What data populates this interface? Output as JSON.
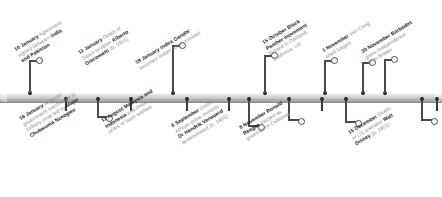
{
  "figure": {
    "name": "1966 events timeline",
    "orientation": "horizontal",
    "axis_color": "#c2c2c2",
    "date_color": "#1c1c1c",
    "body_color": "#8d8d8d",
    "label_rotation_deg": -31
  },
  "chart_data": {
    "type": "table",
    "title": "",
    "xlabel": "",
    "ylabel": "",
    "events": [
      {
        "date": "10 January",
        "side": "above",
        "lines": [
          [
            {
              "t": "10 January",
              "b": true
            },
            {
              "t": " Agreement",
              "b": false
            }
          ],
          [
            {
              "t": "signed between ",
              "b": false
            },
            {
              "t": "India",
              "b": true
            }
          ],
          [
            {
              "t": "and Pakistan",
              "b": true
            }
          ]
        ],
        "text": "10 January Agreement signed between India and Pakistan"
      },
      {
        "date": "11 January",
        "side": "above",
        "lines": [
          [
            {
              "t": "11 January",
              "b": true
            },
            {
              "t": " Death of",
              "b": false
            }
          ],
          [
            {
              "t": "Swiss sculptor ",
              "b": false
            },
            {
              "t": "Alberto",
              "b": true
            }
          ],
          [
            {
              "t": "Giacometti",
              "b": true
            },
            {
              "t": " (b. 1901)",
              "b": false
            }
          ]
        ],
        "text": "11 January Death of Swiss sculptor Alberto Giacometti (b. 1901)"
      },
      {
        "date": "16 January",
        "side": "below",
        "lines": [
          [
            {
              "t": "16 January",
              "b": true
            },
            {
              "t": " Nigerian",
              "b": false
            }
          ],
          [
            {
              "t": "government overthrown in",
              "b": false
            }
          ],
          [
            {
              "t": "military coup led by ",
              "b": false
            },
            {
              "t": "Major",
              "b": true
            }
          ],
          [
            {
              "t": "Chukwuma Nzeogwu",
              "b": true
            }
          ]
        ],
        "text": "16 January Nigerian government overthrown in military coup led by Major Chukwuma Nzeogwu"
      },
      {
        "date": "19 January",
        "side": "above",
        "lines": [
          [
            {
              "t": "19 January Indira Gandhi",
              "b": true
            }
          ],
          [
            {
              "t": "becomes Indian prime minister",
              "b": false
            }
          ]
        ],
        "text": "19 January Indira Gandhi becomes Indian prime minister"
      },
      {
        "date": "11 August",
        "side": "below",
        "lines": [
          [
            {
              "t": "11 August Malaysia and",
              "b": true
            }
          ],
          [
            {
              "t": "Indonesia",
              "b": true
            },
            {
              "t": " end three",
              "b": false
            }
          ],
          [
            {
              "t": "years of bush warfare",
              "b": false
            }
          ]
        ],
        "text": "11 August Malaysia and Indonesia end three years of bush warfare"
      },
      {
        "date": "6 September",
        "side": "below",
        "lines": [
          [
            {
              "t": "6 September",
              "b": true
            },
            {
              "t": " South",
              "b": false
            }
          ],
          [
            {
              "t": "African prime minister",
              "b": false
            }
          ],
          [
            {
              "t": "Dr Hendrik Verwoerd",
              "b": true
            }
          ],
          [
            {
              "t": "assassinated (b. 1901)",
              "b": false
            }
          ]
        ],
        "text": "6 September South African prime minister Dr Hendrik Verwoerd assassinated (b. 1901)"
      },
      {
        "date": "15 October",
        "side": "above",
        "lines": [
          [
            {
              "t": "15 October Black",
              "b": true
            }
          ],
          [
            {
              "t": "Panther movement",
              "b": true
            }
          ],
          [
            {
              "t": "formed in Oakland,",
              "b": false
            }
          ],
          [
            {
              "t": "California, US",
              "b": false
            }
          ]
        ],
        "text": "15 October Black Panther movement formed in Oakland, California, US"
      },
      {
        "date": "1 November",
        "side": "above",
        "lines": [
          [
            {
              "t": "1 November",
              "b": true
            },
            {
              "t": " Viet Cong",
              "b": false
            }
          ],
          [
            {
              "t": "shell Saigon",
              "b": false
            }
          ]
        ],
        "text": "1 November Viet Cong shell Saigon"
      },
      {
        "date": "8 November",
        "side": "below",
        "lines": [
          [
            {
              "t": "8 November Ronald",
              "b": true
            }
          ],
          [
            {
              "t": "Reagan",
              "b": true
            },
            {
              "t": " elected as",
              "b": false
            }
          ],
          [
            {
              "t": "governor of California",
              "b": false
            }
          ]
        ],
        "text": "8 November Ronald Reagan elected as governor of California"
      },
      {
        "date": "30 November",
        "side": "above",
        "lines": [
          [
            {
              "t": "30 November Barbados",
              "b": true
            }
          ],
          [
            {
              "t": "gains independence",
              "b": false
            }
          ],
          [
            {
              "t": "from Britain",
              "b": false
            }
          ]
        ],
        "text": "30 November Barbados gains independence from Britain"
      },
      {
        "date": "15 December",
        "side": "below",
        "lines": [
          [
            {
              "t": "15 December",
              "b": true
            },
            {
              "t": " Death",
              "b": false
            }
          ],
          [
            {
              "t": "of US animator ",
              "b": false
            },
            {
              "t": "Walt",
              "b": true
            }
          ],
          [
            {
              "t": "Disney",
              "b": true
            },
            {
              "t": " (b. 1901)",
              "b": false
            }
          ]
        ],
        "text": "15 December Death of US animator Walt Disney (b. 1901)"
      }
    ]
  },
  "layout": {
    "ticks_above": [
      29,
      172,
      288,
      384,
      558,
      678,
      793,
      971,
      1086,
      1305
    ],
    "geometry": [
      {
        "event": 0,
        "tick": 29,
        "side": "above",
        "stem_h": 33,
        "ring_dx": 10,
        "label_x": 13,
        "label_y": 47
      },
      {
        "event": 1,
        "tick": 172,
        "side": "above",
        "stem_h": 48,
        "ring_dx": 10,
        "label_x": 77,
        "label_y": 50
      },
      {
        "event": 2,
        "tick": 97,
        "side": "below",
        "stem_h": 17,
        "ring_dx": 12,
        "label_x": 18,
        "label_y": 116
      },
      {
        "event": 3,
        "tick": 384,
        "side": "above",
        "stem_h": 34,
        "ring_dx": 10,
        "label_x": 134,
        "label_y": 60
      },
      {
        "event": 4,
        "tick": 288,
        "side": "below",
        "stem_h": 20,
        "ring_dx": 13,
        "label_x": 100,
        "label_y": 118
      },
      {
        "event": 5,
        "tick": 248,
        "side": "below",
        "stem_h": 26,
        "ring_dx": 13,
        "label_x": 170,
        "label_y": 123
      },
      {
        "event": 6,
        "tick": 793,
        "side": "above",
        "stem_h": 38,
        "ring_dx": 10,
        "label_x": 261,
        "label_y": 40
      },
      {
        "event": 7,
        "tick": 971,
        "side": "above",
        "stem_h": 33,
        "ring_dx": 10,
        "label_x": 321,
        "label_y": 48
      },
      {
        "event": 8,
        "tick": 345,
        "side": "below",
        "stem_h": 22,
        "ring_dx": 13,
        "label_x": 238,
        "label_y": 125
      },
      {
        "event": 9,
        "tick": 1086,
        "side": "above",
        "stem_h": 31,
        "ring_dx": 10,
        "label_x": 360,
        "label_y": 49
      },
      {
        "event": 10,
        "tick": 421,
        "side": "below",
        "stem_h": 20,
        "ring_dx": 13,
        "label_x": 347,
        "label_y": 130
      }
    ]
  }
}
